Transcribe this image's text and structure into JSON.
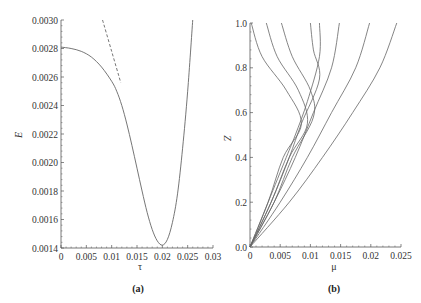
{
  "chart_data": [
    {
      "panel": "(a)",
      "type": "line",
      "title": "",
      "xlabel": "τ",
      "ylabel": "E",
      "xlim": [
        0,
        0.03
      ],
      "ylim": [
        0.0014,
        0.003
      ],
      "x_ticks": [
        "0",
        "0.005",
        "0.01",
        "0.015",
        "0.02",
        "0.025",
        "0.03"
      ],
      "y_ticks": [
        "0.0014",
        "0.0016",
        "0.0018",
        "0.0020",
        "0.0022",
        "0.0024",
        "0.0026",
        "0.0028",
        "0.0030"
      ],
      "grid": false,
      "series": [
        {
          "name": "solid",
          "style": "solid",
          "x": [
            0,
            0.002,
            0.004,
            0.006,
            0.008,
            0.01,
            0.011,
            0.012,
            0.013,
            0.014,
            0.015,
            0.016,
            0.017,
            0.018,
            0.019,
            0.02,
            0.021,
            0.022,
            0.023,
            0.024,
            0.025,
            0.026
          ],
          "y": [
            0.00281,
            0.0028,
            0.00278,
            0.00274,
            0.00267,
            0.00257,
            0.0025,
            0.0024,
            0.00227,
            0.00212,
            0.00196,
            0.0018,
            0.00165,
            0.00153,
            0.00145,
            0.00142,
            0.00146,
            0.00158,
            0.00178,
            0.0021,
            0.0025,
            0.003
          ]
        },
        {
          "name": "dashed",
          "style": "dashed",
          "x": [
            0.0082,
            0.01,
            0.0118
          ],
          "y": [
            0.003,
            0.00278,
            0.00256
          ]
        }
      ]
    },
    {
      "panel": "(b)",
      "type": "line",
      "title": "",
      "xlabel": "μ",
      "ylabel": "Z",
      "xlim": [
        0,
        0.025
      ],
      "ylim": [
        0.0,
        1.0
      ],
      "x_ticks": [
        "0",
        "0.005",
        "0.01",
        "0.015",
        "0.02",
        "0.025"
      ],
      "y_ticks": [
        "0.0",
        "0.2",
        "0.4",
        "0.6",
        "0.8",
        "1.0"
      ],
      "grid": false,
      "series": [
        {
          "name": "curve-1",
          "mu_at_top": 0.0002,
          "points": [
            [
              0,
              0
            ],
            [
              0.003,
              0.2
            ],
            [
              0.0055,
              0.4
            ],
            [
              0.0085,
              0.55
            ],
            [
              0.006,
              0.7
            ],
            [
              0.002,
              0.85
            ],
            [
              0.0002,
              1.0
            ]
          ]
        },
        {
          "name": "curve-2",
          "mu_at_top": 0.0027,
          "points": [
            [
              0,
              0
            ],
            [
              0.0035,
              0.2
            ],
            [
              0.0065,
              0.4
            ],
            [
              0.0095,
              0.55
            ],
            [
              0.008,
              0.7
            ],
            [
              0.0045,
              0.85
            ],
            [
              0.0027,
              1.0
            ]
          ]
        },
        {
          "name": "curve-3",
          "mu_at_top": 0.0052,
          "points": [
            [
              0,
              0
            ],
            [
              0.004,
              0.2
            ],
            [
              0.007,
              0.4
            ],
            [
              0.0105,
              0.58
            ],
            [
              0.01,
              0.7
            ],
            [
              0.007,
              0.85
            ],
            [
              0.0052,
              1.0
            ]
          ]
        },
        {
          "name": "curve-4",
          "mu_at_top": 0.01,
          "points": [
            [
              0,
              0
            ],
            [
              0.0035,
              0.2
            ],
            [
              0.0065,
              0.4
            ],
            [
              0.0085,
              0.55
            ],
            [
              0.0115,
              0.75
            ],
            [
              0.0105,
              0.88
            ],
            [
              0.01,
              1.0
            ]
          ]
        },
        {
          "name": "curve-5",
          "mu_at_top": 0.0115,
          "points": [
            [
              0,
              0
            ],
            [
              0.003,
              0.2
            ],
            [
              0.006,
              0.4
            ],
            [
              0.0075,
              0.5
            ],
            [
              0.0095,
              0.65
            ],
            [
              0.0115,
              0.85
            ],
            [
              0.0115,
              1.0
            ]
          ]
        },
        {
          "name": "curve-6",
          "mu_at_top": 0.0148,
          "points": [
            [
              0,
              0
            ],
            [
              0.004,
              0.2
            ],
            [
              0.0075,
              0.4
            ],
            [
              0.0105,
              0.6
            ],
            [
              0.0135,
              0.8
            ],
            [
              0.0148,
              1.0
            ]
          ]
        },
        {
          "name": "curve-7",
          "mu_at_top": 0.0198,
          "points": [
            [
              0,
              0
            ],
            [
              0.005,
              0.2
            ],
            [
              0.0095,
              0.4
            ],
            [
              0.0135,
              0.6
            ],
            [
              0.0175,
              0.8
            ],
            [
              0.0198,
              1.0
            ]
          ]
        },
        {
          "name": "curve-8",
          "mu_at_top": 0.0243,
          "points": [
            [
              0,
              0
            ],
            [
              0.0065,
              0.2
            ],
            [
              0.012,
              0.4
            ],
            [
              0.017,
              0.6
            ],
            [
              0.0215,
              0.8
            ],
            [
              0.0243,
              1.0
            ]
          ]
        }
      ]
    }
  ],
  "figure": {
    "panel_a_label": "(a)",
    "panel_b_label": "(b)",
    "panel_a_xlabel": "τ",
    "panel_a_ylabel": "E",
    "panel_b_xlabel": "μ",
    "panel_b_ylabel": "Z"
  },
  "colors": {
    "curve": "#666666",
    "axis": "#555555",
    "background": "#ffffff"
  }
}
